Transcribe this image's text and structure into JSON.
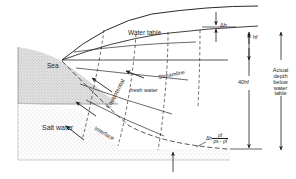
{
  "figure": {
    "type": "cross-section-diagram"
  },
  "labels": {
    "sea": "Sea",
    "salt_water": "Salt water",
    "water_table": "Water table",
    "fresh_water": "fresh water",
    "streamline": "Streamline",
    "equipotential": "Equipotential",
    "interface": "Interface",
    "delta_h": "Δh",
    "hf": "hf",
    "depth_40": "40hf"
  },
  "side_note": {
    "line1": "Actual",
    "line2": "depth",
    "line3": "below",
    "line4": "water",
    "line5": "table"
  },
  "formula": {
    "lead": "Δh",
    "numerator": "ρf",
    "denominator": "ρs - ρf"
  },
  "colors": {
    "ink": "#1f1f1f",
    "line": "#2a2a2a",
    "stipple": "#9a9a9a",
    "sea_fill": "#d8d8d8",
    "background": "#ffffff"
  }
}
